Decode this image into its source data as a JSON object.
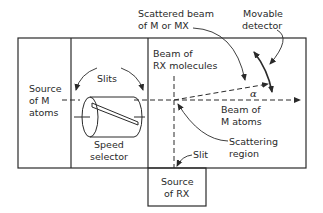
{
  "diagram": {
    "colors": {
      "line": "#2a2a2a",
      "background": "#ffffff"
    },
    "labels": {
      "scattered_beam": [
        "Scattered beam",
        "of M or MX"
      ],
      "movable_detector": [
        "Movable",
        "detector"
      ],
      "beam_rx": [
        "Beam of",
        "RX molecules"
      ],
      "source_m": [
        "Source",
        "of M",
        "atoms"
      ],
      "slits": "Slits",
      "speed_selector": [
        "Speed",
        "selector"
      ],
      "alpha": "α",
      "beam_m": [
        "Beam of",
        "M atoms"
      ],
      "scattering_region": [
        "Scattering",
        "region"
      ],
      "slit": "Slit",
      "source_rx": [
        "Source",
        "of RX"
      ]
    }
  }
}
